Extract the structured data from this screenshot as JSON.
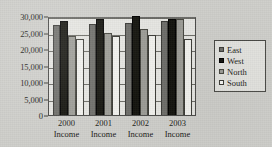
{
  "chart_data": {
    "type": "bar",
    "title": "",
    "subtitle": "",
    "xlabel": "",
    "ylabel": "",
    "grid": true,
    "legend_position": "right",
    "categories": [
      "2000 Income",
      "2001 Income",
      "2002 Income",
      "2003 Income"
    ],
    "category_lines": [
      [
        "2000",
        "Income"
      ],
      [
        "2001",
        "Income"
      ],
      [
        "2002",
        "Income"
      ],
      [
        "2003",
        "Income"
      ]
    ],
    "ylim": [
      0,
      30000
    ],
    "ytick_values": [
      0,
      5000,
      10000,
      15000,
      20000,
      25000,
      30000
    ],
    "ytick_labels": [
      "0",
      "5,000",
      "10,000",
      "15,000",
      "20,000",
      "25,000",
      "30,000"
    ],
    "series": [
      {
        "name": "East",
        "color": "#6f6f6b",
        "values": [
          27200,
          27700,
          28000,
          28500
        ]
      },
      {
        "name": "West",
        "color": "#15150f",
        "values": [
          28500,
          29000,
          30000,
          29000
        ]
      },
      {
        "name": "North",
        "color": "#9d9d97",
        "values": [
          24000,
          25000,
          26000,
          29000
        ]
      },
      {
        "name": "South",
        "color": "#f2f2ee",
        "values": [
          23000,
          24000,
          24300,
          23000
        ]
      }
    ]
  },
  "legend": {
    "items": [
      {
        "label": "East"
      },
      {
        "label": "West"
      },
      {
        "label": "North"
      },
      {
        "label": "South"
      }
    ]
  }
}
